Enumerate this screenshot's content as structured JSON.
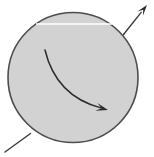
{
  "figure": {
    "type": "diagram",
    "canvas": {
      "width": 154,
      "height": 157,
      "background": "#ffffff"
    },
    "colors": {
      "sphere_fill": "#d2d2d2",
      "sphere_stroke": "#4d4d4d",
      "axis_line": "#3a3a3a",
      "rotation_arrow": "#2b2b2b",
      "highlight_line": "#ffffff"
    },
    "elements": {
      "sphere": {
        "name": "sphere",
        "shape": "circle",
        "cx": 73,
        "cy": 77.5,
        "r": 65,
        "fill": "#d2d2d2",
        "stroke": "#4d4d4d",
        "stroke_width": 1.6
      },
      "axis_arrow": {
        "name": "axis-arrow",
        "description": "straight line from lower-left exterior through sphere to upper-right arrowhead",
        "tail_x": 5,
        "tail_y": 152,
        "tip_x": 147,
        "tip_y": 5,
        "stroke": "#3a3a3a",
        "stroke_width": 1.4,
        "arrowhead": "solid-triangle",
        "arrowhead_length": 11,
        "arrowhead_width": 7,
        "visible_segments": [
          {
            "from_x": 5,
            "from_y": 152,
            "to_x": 30.5,
            "to_y": 133.5
          },
          {
            "from_x": 123.5,
            "from_y": 34.5,
            "to_x": 147,
            "to_y": 5
          }
        ]
      },
      "rotation_arrow": {
        "name": "rotation-arrow",
        "description": "curved arrow inside sphere showing spin direction, sweeping from upper-left down to lower-right",
        "start_x": 45,
        "start_y": 50,
        "control_x": 56,
        "control_y": 96,
        "end_x": 108,
        "end_y": 110,
        "stroke": "#2b2b2b",
        "stroke_width": 1.5,
        "arrowhead": "solid-triangle",
        "arrowhead_length": 12,
        "arrowhead_width": 8
      },
      "highlight_line": {
        "name": "highlight-line",
        "description": "thin white horizontal highlight streak across upper part of sphere",
        "x1": 36,
        "y1": 24,
        "x2": 112,
        "y2": 24,
        "stroke": "#ffffff",
        "stroke_width": 1.4
      }
    }
  }
}
